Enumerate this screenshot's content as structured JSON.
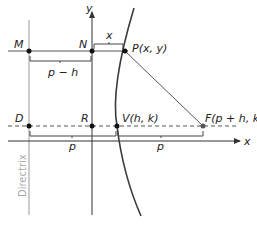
{
  "diagram": {
    "colors": {
      "axis": "#333333",
      "directrix": "#9a9a9a",
      "curve": "#3a3a3a",
      "text": "#222222",
      "directrix_label": "#a8a8a8"
    },
    "axes": {
      "x_label": "x",
      "y_label": "y"
    },
    "directrix_label": "Directrix",
    "points": [
      {
        "id": "M",
        "label": "M"
      },
      {
        "id": "N",
        "label": "N"
      },
      {
        "id": "P",
        "label": "P(x, y)"
      },
      {
        "id": "D",
        "label": "D"
      },
      {
        "id": "R",
        "label": "R"
      },
      {
        "id": "V",
        "label": "V(h, k)"
      },
      {
        "id": "F",
        "label": "F(p + h, k)"
      }
    ],
    "distances": {
      "MN": "p − h",
      "NP": "x",
      "DV": "p",
      "VF": "p"
    }
  }
}
